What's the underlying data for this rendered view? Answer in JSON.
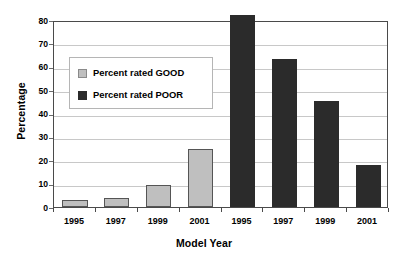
{
  "chart_data": {
    "type": "bar",
    "title": "",
    "xlabel": "Model Year",
    "ylabel": "Percentage",
    "categories": [
      "1995",
      "1997",
      "1999",
      "2001",
      "1995",
      "1997",
      "1999",
      "2001"
    ],
    "series": [
      {
        "name": "Percent rated GOOD",
        "color": "#bfbfbf",
        "values": [
          3,
          4,
          9.5,
          25,
          null,
          null,
          null,
          null
        ]
      },
      {
        "name": "Percent rated POOR",
        "color": "#2b2b2b",
        "values": [
          null,
          null,
          null,
          null,
          82,
          63.5,
          45.5,
          18
        ]
      }
    ],
    "bars": [
      {
        "category": "1995",
        "group": "good",
        "value": 3,
        "color": "#bfbfbf"
      },
      {
        "category": "1997",
        "group": "good",
        "value": 4,
        "color": "#bfbfbf"
      },
      {
        "category": "1999",
        "group": "good",
        "value": 9.5,
        "color": "#bfbfbf"
      },
      {
        "category": "2001",
        "group": "good",
        "value": 25,
        "color": "#bfbfbf"
      },
      {
        "category": "1995",
        "group": "poor",
        "value": 82,
        "color": "#2b2b2b"
      },
      {
        "category": "1997",
        "group": "poor",
        "value": 63.5,
        "color": "#2b2b2b"
      },
      {
        "category": "1999",
        "group": "poor",
        "value": 45.5,
        "color": "#2b2b2b"
      },
      {
        "category": "2001",
        "group": "poor",
        "value": 18,
        "color": "#2b2b2b"
      }
    ],
    "ylim": [
      0,
      80
    ],
    "yticks": [
      0,
      10,
      20,
      30,
      40,
      50,
      60,
      70,
      80
    ],
    "ytick_labels": [
      "0",
      "10",
      "20",
      "30",
      "40",
      "50",
      "60",
      "70",
      "80"
    ],
    "grid": true,
    "grid_axis": "y",
    "legend": {
      "position": "upper-left-inside",
      "entries": [
        {
          "label": "Percent rated GOOD",
          "swatch": "good",
          "color": "#bfbfbf"
        },
        {
          "label": "Percent rated POOR",
          "swatch": "poor",
          "color": "#2b2b2b"
        }
      ]
    }
  }
}
